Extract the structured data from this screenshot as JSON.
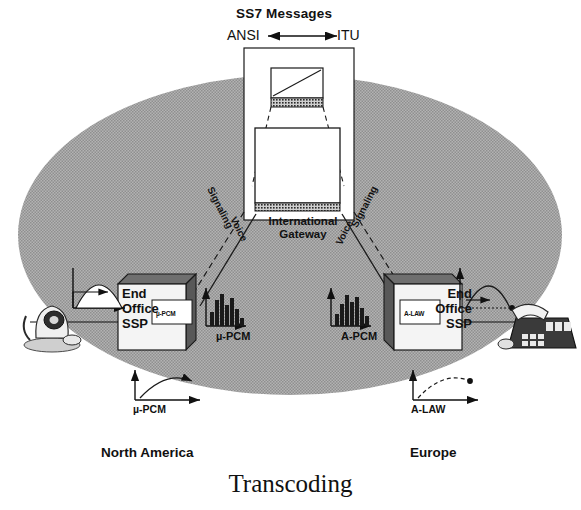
{
  "diagram": {
    "caption": "Transcoding",
    "ss7": {
      "title": "SS7 Messages",
      "left_standard": "ANSI",
      "right_standard": "ITU",
      "arrow": "double-headed-arrow"
    },
    "gateway": {
      "label_line1": "International",
      "label_line2": "Gateway",
      "switch_icon": "network-switch-icon"
    },
    "regions": {
      "left": "North America",
      "right": "Europe"
    },
    "nodes": {
      "left": {
        "line1": "End",
        "line2": "Office",
        "line3": "SSP",
        "inset": "µ-PCM"
      },
      "right": {
        "line1": "End",
        "line2": "Office",
        "line3": "SSP",
        "inset": "A-LAW"
      }
    },
    "encodings": {
      "left_pcm": "µ-PCM",
      "right_pcm": "A-PCM",
      "left_law": "µ-PCM",
      "right_law": "A-LAW"
    },
    "links": {
      "signaling_left": "Signaling",
      "voice_left": "Voice",
      "signaling_right": "Signaling",
      "voice_right": "Voice"
    },
    "devices": {
      "left": "rotary-telephone-icon",
      "right": "business-desk-phone-icon"
    },
    "colors": {
      "ellipse_fill": "#a9a9a9",
      "stroke": "#1a1a1a",
      "white": "#ffffff"
    }
  }
}
